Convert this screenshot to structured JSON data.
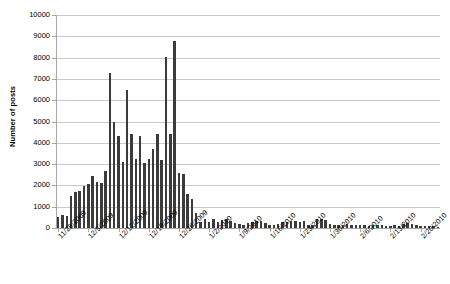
{
  "chart_data": {
    "type": "bar",
    "title": "",
    "xlabel": "",
    "ylabel": "Number of posts",
    "ylim": [
      0,
      10000
    ],
    "ytick_values": [
      0,
      1000,
      2000,
      3000,
      4000,
      5000,
      6000,
      7000,
      8000,
      9000,
      10000
    ],
    "ytick_labels": [
      "0",
      "1000",
      "2000",
      "3000",
      "4000",
      "5000",
      "6000",
      "7000",
      "8000",
      "9000",
      "10000"
    ],
    "grid": true,
    "legend": false,
    "legend_position": "none",
    "xtick_labels": [
      "11/28/2009",
      "12/5/2009",
      "12/12/2009",
      "12/19/2009",
      "12/26/2009",
      "1/2/2010",
      "1/9/2010",
      "1/16/2010",
      "1/23/2010",
      "1/30/2010",
      "2/6/2010",
      "2/13/2010",
      "2/20/2010"
    ],
    "xtick_indices": [
      0,
      7,
      14,
      21,
      28,
      35,
      42,
      49,
      56,
      63,
      70,
      77,
      84
    ],
    "bar_color": "#3b3b3b",
    "categories": [
      "11/28/2009",
      "11/29/2009",
      "11/30/2009",
      "12/1/2009",
      "12/2/2009",
      "12/3/2009",
      "12/4/2009",
      "12/5/2009",
      "12/6/2009",
      "12/7/2009",
      "12/8/2009",
      "12/9/2009",
      "12/10/2009",
      "12/11/2009",
      "12/12/2009",
      "12/13/2009",
      "12/14/2009",
      "12/15/2009",
      "12/16/2009",
      "12/17/2009",
      "12/18/2009",
      "12/19/2009",
      "12/20/2009",
      "12/21/2009",
      "12/22/2009",
      "12/23/2009",
      "12/24/2009",
      "12/25/2009",
      "12/26/2009",
      "12/27/2009",
      "12/28/2009",
      "12/29/2009",
      "12/30/2009",
      "12/31/2009",
      "1/1/2010",
      "1/2/2010",
      "1/3/2010",
      "1/4/2010",
      "1/5/2010",
      "1/6/2010",
      "1/7/2010",
      "1/8/2010",
      "1/9/2010",
      "1/10/2010",
      "1/11/2010",
      "1/12/2010",
      "1/13/2010",
      "1/14/2010",
      "1/15/2010",
      "1/16/2010",
      "1/17/2010",
      "1/18/2010",
      "1/19/2010",
      "1/20/2010",
      "1/21/2010",
      "1/22/2010",
      "1/23/2010",
      "1/24/2010",
      "1/25/2010",
      "1/26/2010",
      "1/27/2010",
      "1/28/2010",
      "1/29/2010",
      "1/30/2010",
      "1/31/2010",
      "2/1/2010",
      "2/2/2010",
      "2/3/2010",
      "2/4/2010",
      "2/5/2010",
      "2/6/2010",
      "2/7/2010",
      "2/8/2010",
      "2/9/2010",
      "2/10/2010",
      "2/11/2010",
      "2/12/2010",
      "2/13/2010",
      "2/14/2010",
      "2/15/2010",
      "2/16/2010",
      "2/17/2010",
      "2/18/2010",
      "2/19/2010",
      "2/20/2010",
      "2/21/2010",
      "2/22/2010",
      "2/23/2010",
      "2/24/2010"
    ],
    "values": [
      500,
      620,
      560,
      1500,
      1700,
      1750,
      1950,
      2050,
      2450,
      2150,
      2100,
      2700,
      7300,
      5000,
      4300,
      3100,
      6500,
      4400,
      3250,
      4300,
      3050,
      3250,
      3700,
      4400,
      3200,
      8050,
      4400,
      8800,
      2600,
      2550,
      1600,
      1350,
      700,
      300,
      400,
      280,
      420,
      300,
      380,
      400,
      330,
      250,
      170,
      150,
      230,
      300,
      320,
      330,
      240,
      150,
      120,
      170,
      300,
      260,
      350,
      330,
      260,
      330,
      150,
      120,
      430,
      420,
      380,
      170,
      120,
      140,
      130,
      170,
      130,
      120,
      130,
      140,
      110,
      120,
      160,
      120,
      110,
      100,
      120,
      110,
      200,
      230,
      210,
      130,
      110,
      100,
      90,
      80,
      70
    ]
  }
}
